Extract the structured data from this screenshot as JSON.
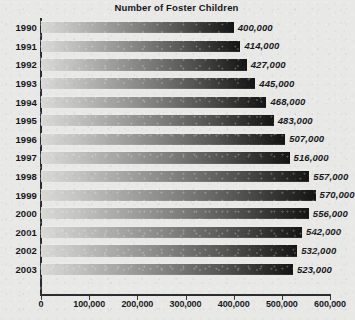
{
  "chart_data": {
    "type": "bar",
    "orientation": "horizontal",
    "title": "Number of Foster Children",
    "xlabel": "",
    "ylabel": "",
    "xlim": [
      0,
      600000
    ],
    "grid": false,
    "legend": null,
    "categories": [
      "1990",
      "1991",
      "1992",
      "1993",
      "1994",
      "1995",
      "1996",
      "1997",
      "1998",
      "1999",
      "2000",
      "2001",
      "2002",
      "2003"
    ],
    "values": [
      400000,
      414000,
      427000,
      445000,
      468000,
      483000,
      507000,
      516000,
      557000,
      570000,
      556000,
      542000,
      532000,
      523000
    ],
    "value_labels": [
      "400,000",
      "414,000",
      "427,000",
      "445,000",
      "468,000",
      "483,000",
      "507,000",
      "516,000",
      "557,000",
      "570,000",
      "556,000",
      "542,000",
      "532,000",
      "523,000"
    ],
    "x_ticks": [
      0,
      100000,
      200000,
      300000,
      400000,
      500000,
      600000
    ],
    "x_tick_labels": [
      "0",
      "100,000",
      "200,000",
      "300,000",
      "400,000",
      "500,000",
      "600,000"
    ],
    "colors": {
      "background": "#e8e8e6",
      "bar_gradient_start": "#d9d9d6",
      "bar_gradient_end": "#141414",
      "axis": "#2b2b30",
      "text": "#15151a"
    }
  }
}
